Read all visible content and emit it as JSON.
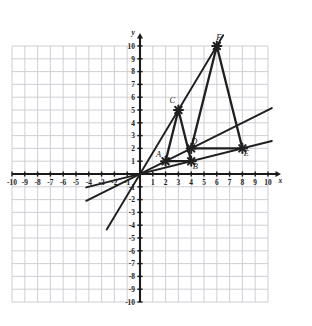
{
  "chart_data": {
    "type": "scatter",
    "title": "",
    "xlabel": "x",
    "ylabel": "y",
    "xlim": [
      -10,
      10
    ],
    "ylim": [
      -10,
      10
    ],
    "grid": true,
    "grid_step": 1,
    "legend": "none",
    "x_ticks": [
      "-10",
      "-9",
      "-8",
      "-7",
      "-6",
      "-5",
      "-4",
      "-3",
      "-2",
      "-1",
      "1",
      "2",
      "3",
      "4",
      "5",
      "6",
      "7",
      "8",
      "9",
      "10"
    ],
    "y_ticks": [
      "10",
      "9",
      "8",
      "7",
      "6",
      "5",
      "4",
      "3",
      "2",
      "1",
      "-1",
      "-2",
      "-3",
      "-4",
      "-5",
      "-6",
      "-7",
      "-8",
      "-9",
      "-10"
    ],
    "points": [
      {
        "label": "A",
        "x": 2,
        "y": 1,
        "label_dx": -7,
        "label_dy": -4
      },
      {
        "label": "B",
        "x": 4,
        "y": 1,
        "label_dx": 4,
        "label_dy": 8
      },
      {
        "label": "C",
        "x": 3,
        "y": 5,
        "label_dx": -6,
        "label_dy": -7
      },
      {
        "label": "D",
        "x": 4,
        "y": 2,
        "label_dx": 3,
        "label_dy": -4
      },
      {
        "label": "E",
        "x": 8,
        "y": 2,
        "label_dx": 4,
        "label_dy": 8
      },
      {
        "label": "F",
        "x": 6,
        "y": 10,
        "label_dx": 2,
        "label_dy": -6
      }
    ],
    "polygons": [
      {
        "name": "triangle-ABC",
        "vertices": [
          "A",
          "B",
          "C"
        ]
      },
      {
        "name": "triangle-DEF",
        "vertices": [
          "D",
          "E",
          "F"
        ]
      }
    ],
    "lines": [
      {
        "name": "line-slope-five-thirds",
        "slope": 1.6667,
        "x_start": -2.6,
        "x_end": 6.5,
        "note": "passes through origin, C and F"
      },
      {
        "name": "line-slope-one-half",
        "slope": 0.5,
        "x_start": -4.2,
        "x_end": 10.3,
        "note": "passes through origin and D"
      },
      {
        "name": "line-slope-one-quarter",
        "slope": 0.25,
        "x_start": -4.2,
        "x_end": 10.3,
        "note": "passes through origin and B"
      }
    ]
  },
  "colors": {
    "grid": "#c9c9d2",
    "axis": "#1a1a1a",
    "stroke": "#1f1f1f",
    "background": "#ffffff"
  }
}
